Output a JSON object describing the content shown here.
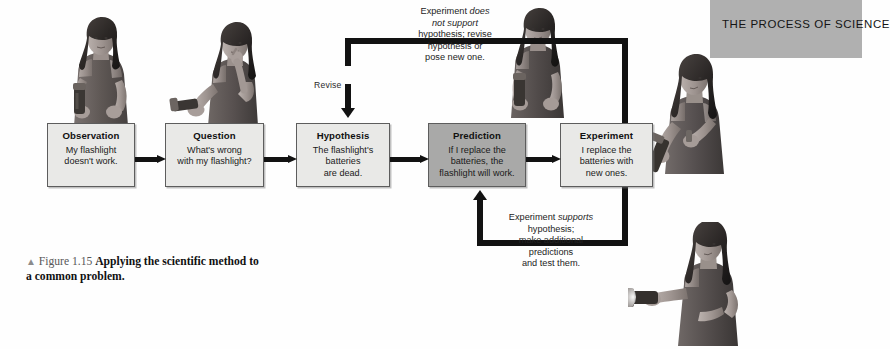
{
  "banner": {
    "label": "THE PROCESS OF SCIENCE",
    "bg_color": "#b0b0b0"
  },
  "diagram": {
    "title": "Applying the scientific method to a common problem",
    "box_fill": "#e9e9e7",
    "highlight_fill": "#a9a9a8",
    "arrow_color": "#121212",
    "nodes": [
      {
        "id": "observation",
        "title": "Observation",
        "line1": "My flashlight",
        "line2": "doesn't work.",
        "line3": "",
        "highlighted": false
      },
      {
        "id": "question",
        "title": "Question",
        "line1": "What's wrong",
        "line2": "with my flashlight?",
        "line3": "",
        "highlighted": false
      },
      {
        "id": "hypothesis",
        "title": "Hypothesis",
        "line1": "The flashlight's",
        "line2": "batteries",
        "line3": "are dead.",
        "highlighted": false
      },
      {
        "id": "prediction",
        "title": "Prediction",
        "line1": "If I replace the",
        "line2": "batteries, the",
        "line3": "flashlight will work.",
        "highlighted": true
      },
      {
        "id": "experiment",
        "title": "Experiment",
        "line1": "I replace the",
        "line2": "batteries with",
        "line3": "new ones.",
        "highlighted": false
      }
    ],
    "revise_label": "Revise",
    "negative_feedback": {
      "l1_a": "Experiment ",
      "l1_i": "does",
      "l2_i": "not support",
      "l3": "hypothesis; revise",
      "l4": "hypothesis or",
      "l5": "pose new one."
    },
    "positive_feedback": {
      "l1_a": "Experiment ",
      "l1_i": "supports",
      "l2": "hypothesis;",
      "l3": "make additional",
      "l4": "predictions",
      "l5": "and test them."
    }
  },
  "caption": {
    "triangle": "▲",
    "figure_number": "Figure 1.15",
    "bold_text": "Applying the scientific method to a common problem."
  },
  "photos": [
    {
      "id": "photo-woman-holding-flashlight",
      "alt": "Woman holding a flashlight"
    },
    {
      "id": "photo-woman-pondering-flashlight",
      "alt": "Woman pondering with flashlight"
    },
    {
      "id": "photo-woman-shaking-flashlight",
      "alt": "Woman shaking a flashlight"
    },
    {
      "id": "photo-woman-replacing-batteries",
      "alt": "Woman replacing batteries in flashlight"
    },
    {
      "id": "photo-woman-lit-flashlight",
      "alt": "Woman holding a working lit flashlight"
    }
  ]
}
